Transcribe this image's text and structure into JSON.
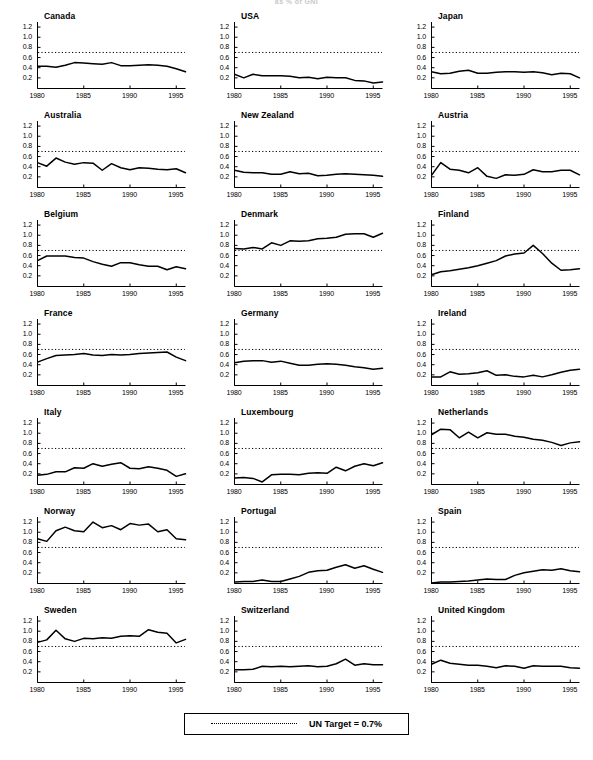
{
  "supertitle": "as % of GNI",
  "legend": {
    "marker": "dotted-line",
    "label": "UN Target = 0.7%"
  },
  "axes": {
    "y_ticks": [
      "1.2",
      "1.0",
      "0.8",
      "0.6",
      "0.4",
      "0.2"
    ],
    "x_ticks": [
      "1980",
      "1985",
      "1990",
      "1995"
    ],
    "ylim": [
      0.0,
      1.3
    ],
    "xlim": [
      1980,
      1996
    ]
  },
  "chart_data": {
    "type": "line",
    "title": "as % of GNI",
    "xlabel": "",
    "ylabel": "",
    "xlim": [
      1980,
      1996
    ],
    "ylim": [
      0.0,
      1.3
    ],
    "y_ticks": [
      0.2,
      0.4,
      0.6,
      0.8,
      1.0,
      1.2
    ],
    "x_ticks": [
      1980,
      1985,
      1990,
      1995
    ],
    "grid": false,
    "legend_position": "bottom-center",
    "reference_line": {
      "label": "UN Target = 0.7%",
      "value": 0.7,
      "style": "dotted"
    },
    "x": [
      1980,
      1981,
      1982,
      1983,
      1984,
      1985,
      1986,
      1987,
      1988,
      1989,
      1990,
      1991,
      1992,
      1993,
      1994,
      1995,
      1996
    ],
    "panels": [
      {
        "name": "Canada",
        "values": [
          0.43,
          0.43,
          0.41,
          0.45,
          0.5,
          0.49,
          0.48,
          0.47,
          0.5,
          0.44,
          0.44,
          0.45,
          0.46,
          0.45,
          0.43,
          0.38,
          0.32
        ]
      },
      {
        "name": "USA",
        "values": [
          0.27,
          0.2,
          0.27,
          0.24,
          0.24,
          0.24,
          0.23,
          0.2,
          0.21,
          0.18,
          0.21,
          0.2,
          0.2,
          0.15,
          0.14,
          0.1,
          0.12
        ]
      },
      {
        "name": "Japan",
        "values": [
          0.32,
          0.28,
          0.29,
          0.33,
          0.35,
          0.29,
          0.29,
          0.31,
          0.32,
          0.32,
          0.31,
          0.32,
          0.3,
          0.26,
          0.29,
          0.28,
          0.2
        ]
      },
      {
        "name": "Australia",
        "values": [
          0.48,
          0.41,
          0.57,
          0.49,
          0.45,
          0.48,
          0.47,
          0.33,
          0.46,
          0.38,
          0.34,
          0.38,
          0.37,
          0.35,
          0.34,
          0.36,
          0.28
        ]
      },
      {
        "name": "New Zealand",
        "values": [
          0.33,
          0.29,
          0.28,
          0.28,
          0.25,
          0.25,
          0.3,
          0.26,
          0.27,
          0.22,
          0.23,
          0.25,
          0.26,
          0.25,
          0.24,
          0.23,
          0.21
        ]
      },
      {
        "name": "Austria",
        "values": [
          0.23,
          0.48,
          0.35,
          0.33,
          0.28,
          0.38,
          0.21,
          0.17,
          0.24,
          0.23,
          0.25,
          0.34,
          0.3,
          0.3,
          0.33,
          0.33,
          0.24
        ]
      },
      {
        "name": "Belgium",
        "values": [
          0.5,
          0.59,
          0.59,
          0.59,
          0.56,
          0.55,
          0.48,
          0.43,
          0.39,
          0.46,
          0.46,
          0.42,
          0.39,
          0.39,
          0.32,
          0.38,
          0.34
        ]
      },
      {
        "name": "Denmark",
        "values": [
          0.74,
          0.73,
          0.76,
          0.73,
          0.85,
          0.8,
          0.89,
          0.88,
          0.89,
          0.93,
          0.94,
          0.96,
          1.02,
          1.03,
          1.03,
          0.96,
          1.04
        ]
      },
      {
        "name": "Finland",
        "values": [
          0.22,
          0.28,
          0.3,
          0.33,
          0.36,
          0.4,
          0.45,
          0.5,
          0.59,
          0.63,
          0.65,
          0.8,
          0.64,
          0.45,
          0.31,
          0.32,
          0.34
        ]
      },
      {
        "name": "France",
        "values": [
          0.45,
          0.52,
          0.58,
          0.59,
          0.6,
          0.62,
          0.59,
          0.58,
          0.6,
          0.59,
          0.6,
          0.62,
          0.63,
          0.64,
          0.65,
          0.55,
          0.48
        ]
      },
      {
        "name": "Germany",
        "values": [
          0.44,
          0.47,
          0.48,
          0.48,
          0.45,
          0.47,
          0.43,
          0.39,
          0.39,
          0.41,
          0.42,
          0.41,
          0.39,
          0.36,
          0.34,
          0.31,
          0.33
        ]
      },
      {
        "name": "Ireland",
        "values": [
          0.16,
          0.16,
          0.26,
          0.21,
          0.22,
          0.24,
          0.28,
          0.19,
          0.2,
          0.17,
          0.16,
          0.19,
          0.16,
          0.2,
          0.25,
          0.29,
          0.31
        ]
      },
      {
        "name": "Italy",
        "values": [
          0.17,
          0.19,
          0.24,
          0.24,
          0.32,
          0.31,
          0.4,
          0.35,
          0.39,
          0.42,
          0.31,
          0.3,
          0.34,
          0.31,
          0.27,
          0.15,
          0.2
        ]
      },
      {
        "name": "Luxembourg",
        "values": [
          0.12,
          0.13,
          0.11,
          0.04,
          0.18,
          0.19,
          0.19,
          0.18,
          0.21,
          0.22,
          0.21,
          0.33,
          0.26,
          0.35,
          0.4,
          0.36,
          0.42
        ]
      },
      {
        "name": "Netherlands",
        "values": [
          0.97,
          1.08,
          1.07,
          0.91,
          1.02,
          0.91,
          1.01,
          0.98,
          0.98,
          0.94,
          0.92,
          0.88,
          0.86,
          0.82,
          0.76,
          0.81,
          0.83
        ]
      },
      {
        "name": "Norway",
        "values": [
          0.87,
          0.82,
          1.03,
          1.1,
          1.03,
          1.01,
          1.2,
          1.09,
          1.13,
          1.05,
          1.17,
          1.14,
          1.16,
          1.01,
          1.05,
          0.87,
          0.85
        ]
      },
      {
        "name": "Portugal",
        "values": [
          0.02,
          0.03,
          0.03,
          0.06,
          0.03,
          0.03,
          0.08,
          0.13,
          0.21,
          0.24,
          0.25,
          0.31,
          0.36,
          0.29,
          0.34,
          0.27,
          0.21
        ]
      },
      {
        "name": "Spain",
        "values": [
          0.0,
          0.02,
          0.02,
          0.03,
          0.04,
          0.06,
          0.08,
          0.07,
          0.07,
          0.15,
          0.2,
          0.23,
          0.26,
          0.25,
          0.28,
          0.24,
          0.22
        ]
      },
      {
        "name": "Sweden",
        "values": [
          0.78,
          0.83,
          1.02,
          0.85,
          0.8,
          0.86,
          0.85,
          0.87,
          0.86,
          0.9,
          0.91,
          0.9,
          1.03,
          0.98,
          0.96,
          0.77,
          0.84
        ]
      },
      {
        "name": "Switzerland",
        "values": [
          0.24,
          0.24,
          0.25,
          0.31,
          0.3,
          0.31,
          0.3,
          0.31,
          0.32,
          0.3,
          0.31,
          0.36,
          0.45,
          0.33,
          0.36,
          0.34,
          0.34
        ]
      },
      {
        "name": "United Kingdom",
        "values": [
          0.35,
          0.43,
          0.37,
          0.35,
          0.33,
          0.33,
          0.31,
          0.28,
          0.32,
          0.31,
          0.27,
          0.32,
          0.31,
          0.31,
          0.31,
          0.28,
          0.27
        ]
      }
    ]
  }
}
